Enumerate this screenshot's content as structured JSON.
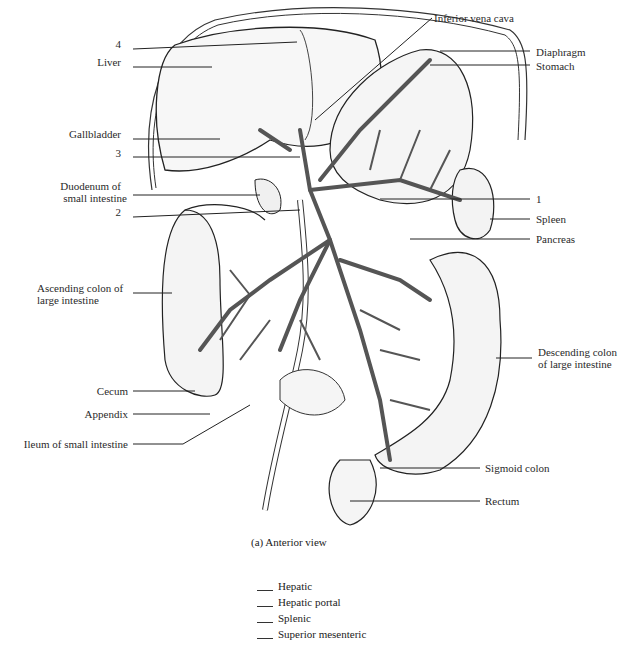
{
  "figure": {
    "caption": "(a) Anterior view",
    "labels_left": [
      {
        "text": "4",
        "x": 125,
        "y": 44
      },
      {
        "text": "Liver",
        "x": 127,
        "y": 62
      },
      {
        "text": "Gallbladder",
        "x": 127,
        "y": 134
      },
      {
        "text": "3",
        "x": 125,
        "y": 153
      },
      {
        "text": "Duodenum of",
        "x": 127,
        "y": 185
      },
      {
        "text": "small intestine",
        "x": 127,
        "y": 197
      },
      {
        "text": "2",
        "x": 125,
        "y": 212
      },
      {
        "text": "Ascending colon of",
        "x": 127,
        "y": 283
      },
      {
        "text": "large intestine",
        "x": 102,
        "y": 295
      },
      {
        "text": "Cecum",
        "x": 127,
        "y": 386
      },
      {
        "text": "Appendix",
        "x": 127,
        "y": 409
      },
      {
        "text": "Ileum of small intestine",
        "x": 127,
        "y": 438
      }
    ],
    "labels_right": [
      {
        "text": "Inferior vena cava",
        "x": 434,
        "y": 13
      },
      {
        "text": "Diaphragm",
        "x": 536,
        "y": 46
      },
      {
        "text": "Stomach",
        "x": 536,
        "y": 60
      },
      {
        "text": "1",
        "x": 536,
        "y": 193
      },
      {
        "text": "Spleen",
        "x": 536,
        "y": 213
      },
      {
        "text": "Pancreas",
        "x": 536,
        "y": 234
      },
      {
        "text": "Descending colon",
        "x": 538,
        "y": 348
      },
      {
        "text": "of large intestine",
        "x": 538,
        "y": 360
      },
      {
        "text": "Sigmoid colon",
        "x": 485,
        "y": 462
      },
      {
        "text": "Rectum",
        "x": 485,
        "y": 495
      }
    ]
  },
  "legend": {
    "items": [
      "Hepatic",
      "Hepatic portal",
      "Splenic",
      "Superior mesenteric"
    ]
  }
}
